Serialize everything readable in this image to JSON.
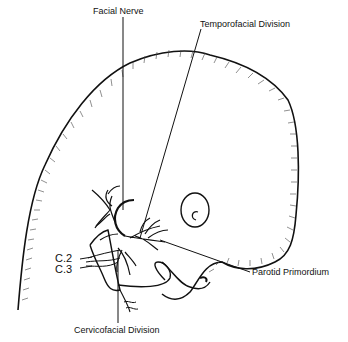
{
  "diagram": {
    "labels": {
      "facial_nerve": "Facial Nerve",
      "temporofacial": "Temporofacial Division",
      "parotid": "Parotid Primordium",
      "cervicofacial": "Cervicofacial Division",
      "c2": "C.2",
      "c3": "C.3"
    }
  }
}
